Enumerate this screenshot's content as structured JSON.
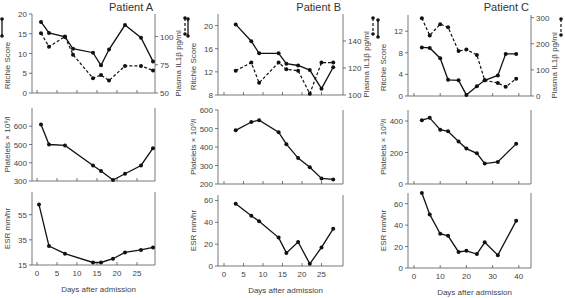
{
  "chart_data": [
    {
      "type": "line",
      "title": "Patient A",
      "panels": [
        {
          "name": "ritchie-il1b",
          "ylabel": "Ritchie Score",
          "ylabel_right": "Plasma IL1β pg/ml",
          "ylim": [
            0,
            20
          ],
          "yticks": [
            0,
            5,
            10,
            15,
            20
          ],
          "ylim_right": [
            50,
            120
          ],
          "yticks_right": [
            50,
            75,
            100
          ],
          "series": [
            {
              "name": "Ritchie Score",
              "style": "solid",
              "axis": "left",
              "x": [
                1,
                3,
                7,
                9,
                14,
                16,
                18,
                22,
                26,
                29
              ],
              "y": [
                18,
                15.2,
                14.2,
                11.2,
                10.2,
                7,
                11,
                17.2,
                14,
                8
              ]
            },
            {
              "name": "Plasma IL1β",
              "style": "dashed",
              "axis": "right",
              "x": [
                1,
                3,
                7,
                9,
                14,
                16,
                18,
                22,
                26,
                29
              ],
              "y": [
                103,
                91,
                100,
                84,
                63,
                66,
                61,
                74,
                74,
                70
              ]
            }
          ]
        },
        {
          "name": "platelets",
          "ylabel": "Platelets × 10⁹/l",
          "ylim": [
            300,
            700
          ],
          "yticks": [
            300,
            400,
            500,
            600
          ],
          "series": [
            {
              "name": "Platelets",
              "style": "solid",
              "x": [
                1,
                3,
                7,
                14,
                16,
                19,
                22,
                26,
                29
              ],
              "y": [
                610,
                500,
                495,
                385,
                355,
                305,
                340,
                385,
                480
              ]
            }
          ]
        },
        {
          "name": "esr",
          "ylabel": "ESR mm/hr",
          "ylim": [
            15,
            73
          ],
          "yticks": [
            15,
            35,
            55
          ],
          "xlabel": "Days after admission",
          "xticks": [
            0,
            5,
            10,
            15,
            20,
            25
          ],
          "series": [
            {
              "name": "ESR",
              "style": "solid",
              "x": [
                0.5,
                3,
                7,
                14,
                16,
                19,
                22,
                26,
                29
              ],
              "y": [
                63,
                30,
                24,
                17,
                17,
                20,
                25,
                27,
                29
              ]
            }
          ]
        }
      ]
    },
    {
      "type": "line",
      "title": "Patient B",
      "panels": [
        {
          "name": "ritchie-il1b",
          "ylabel": "Ritchie Score",
          "ylabel_right": "Plasma IL1β pg/ml",
          "ylim": [
            8,
            22
          ],
          "yticks": [
            8,
            12,
            16,
            20
          ],
          "ylim_right": [
            100,
            160
          ],
          "yticks_right": [
            100,
            120,
            140
          ],
          "series": [
            {
              "name": "Ritchie Score",
              "style": "solid",
              "axis": "left",
              "x": [
                3,
                7,
                9,
                14,
                16,
                19,
                22,
                25,
                28
              ],
              "y": [
                20.2,
                17.3,
                15.2,
                15.2,
                13.4,
                13.1,
                12.3,
                9.1,
                12.8
              ]
            },
            {
              "name": "Plasma IL1β",
              "style": "dashed",
              "axis": "right",
              "x": [
                3,
                7,
                9,
                14,
                16,
                19,
                22,
                25,
                28
              ],
              "y": [
                118,
                124,
                109,
                124,
                119,
                118,
                101,
                124,
                124
              ]
            }
          ]
        },
        {
          "name": "platelets",
          "ylabel": "Platelets × 10⁹/l",
          "ylim": [
            200,
            600
          ],
          "yticks": [
            200,
            300,
            400,
            500,
            600
          ],
          "series": [
            {
              "name": "Platelets",
              "style": "solid",
              "x": [
                3,
                7,
                9,
                14,
                16,
                19,
                22,
                25,
                28
              ],
              "y": [
                490,
                535,
                545,
                480,
                415,
                340,
                290,
                230,
                225
              ]
            }
          ]
        },
        {
          "name": "esr",
          "ylabel": "ESR mm/hr",
          "ylim": [
            0,
            65
          ],
          "yticks": [
            0,
            20,
            40,
            60
          ],
          "xlabel": "Days after admission",
          "xticks": [
            0,
            5,
            10,
            15,
            20,
            25
          ],
          "series": [
            {
              "name": "ESR",
              "style": "solid",
              "x": [
                3,
                7,
                9,
                14,
                16,
                19,
                22,
                25,
                28
              ],
              "y": [
                57,
                46,
                41,
                26,
                12,
                22,
                2,
                17,
                34
              ]
            }
          ]
        }
      ]
    },
    {
      "type": "line",
      "title": "Patient C",
      "panels": [
        {
          "name": "ritchie-il1b",
          "ylabel": "Ritchie Score",
          "ylabel_right": "Plasma IL1β pg/ml",
          "ylim": [
            0,
            15
          ],
          "yticks": [
            0,
            4,
            8,
            12
          ],
          "ylim_right": [
            0,
            310
          ],
          "yticks_right": [
            0,
            100,
            200,
            300
          ],
          "series": [
            {
              "name": "Ritchie Score",
              "style": "solid",
              "axis": "left",
              "x": [
                3,
                6,
                10,
                13,
                17,
                20,
                24,
                27,
                32,
                35,
                39
              ],
              "y": [
                9,
                8.9,
                7,
                3,
                2.9,
                0.2,
                1.8,
                2.9,
                3.8,
                7.8,
                7.8
              ]
            },
            {
              "name": "Plasma IL1β",
              "style": "dashed",
              "axis": "right",
              "x": [
                3,
                6,
                10,
                13,
                17,
                20,
                24,
                27,
                32,
                35,
                39
              ],
              "y": [
                298,
                232,
                275,
                263,
                172,
                178,
                157,
                60,
                50,
                35,
                66
              ]
            }
          ]
        },
        {
          "name": "platelets",
          "ylabel": "Platelets × 10⁹/l",
          "ylim": [
            0,
            470
          ],
          "yticks": [
            0,
            200,
            400
          ],
          "series": [
            {
              "name": "Platelets",
              "style": "solid",
              "x": [
                3,
                6,
                10,
                13,
                17,
                20,
                24,
                27,
                32,
                39
              ],
              "y": [
                405,
                420,
                345,
                335,
                270,
                225,
                195,
                130,
                140,
                255
              ]
            }
          ]
        },
        {
          "name": "esr",
          "ylabel": "ESR mm/hr",
          "ylim": [
            0,
            70
          ],
          "yticks": [
            0,
            20,
            40,
            60
          ],
          "xlabel": "Days after admission",
          "xticks": [
            0,
            10,
            20,
            30,
            40
          ],
          "series": [
            {
              "name": "ESR",
              "style": "solid",
              "x": [
                3,
                6,
                10,
                13,
                17,
                20,
                24,
                27,
                32,
                39
              ],
              "y": [
                70,
                50,
                32,
                30,
                15,
                16,
                13,
                24,
                12,
                44
              ]
            }
          ]
        }
      ]
    }
  ],
  "layout": {
    "columns": [
      {
        "x0": 37,
        "px_per_day": 4.0,
        "xmax_day": 30,
        "plot_left": 32,
        "plot_right": 155,
        "panels": [
          {
            "top": 14,
            "bottom": 93
          },
          {
            "top": 108,
            "bottom": 181
          },
          {
            "top": 192,
            "bottom": 265
          }
        ]
      },
      {
        "x0": 224,
        "px_per_day": 3.9,
        "xmax_day": 29,
        "plot_left": 218,
        "plot_right": 343,
        "panels": [
          {
            "top": 14,
            "bottom": 95
          },
          {
            "top": 110,
            "bottom": 184
          },
          {
            "top": 195,
            "bottom": 266
          }
        ]
      },
      {
        "x0": 414,
        "px_per_day": 2.62,
        "xmax_day": 44,
        "plot_left": 408,
        "plot_right": 531,
        "panels": [
          {
            "top": 15,
            "bottom": 96
          },
          {
            "top": 110,
            "bottom": 184
          },
          {
            "top": 193,
            "bottom": 268
          }
        ]
      }
    ]
  },
  "legend": {
    "ritchie_symbol": "solid-line-dots",
    "il1b_symbol": "dashed-line-dots"
  }
}
